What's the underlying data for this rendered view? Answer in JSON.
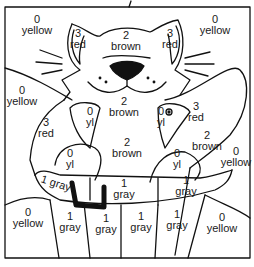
{
  "page": {
    "type": "color-by-number"
  },
  "legend_colors": {
    "0": {
      "name": "yellow",
      "hex": "#f5d90a"
    },
    "1": {
      "name": "gray",
      "hex": "#9a9a9a"
    },
    "2": {
      "name": "brown",
      "hex": "#8b5a2b"
    },
    "3": {
      "name": "red",
      "hex": "#d62a2a"
    }
  },
  "regions": [
    {
      "id": "bg-top-left",
      "num": "0",
      "color": "yellow"
    },
    {
      "id": "ear-left",
      "num": "3",
      "color": "red"
    },
    {
      "id": "head",
      "num": "2",
      "color": "brown"
    },
    {
      "id": "ear-right",
      "num": "3",
      "color": "red"
    },
    {
      "id": "bg-top-right",
      "num": "0",
      "color": "yellow"
    },
    {
      "id": "bg-left-mid",
      "num": "0",
      "color": "yellow"
    },
    {
      "id": "arm-left",
      "num": "3",
      "color": "red"
    },
    {
      "id": "fish-left",
      "num": "0",
      "color": "yl"
    },
    {
      "id": "chest",
      "num": "2",
      "color": "brown"
    },
    {
      "id": "fish-right",
      "num": "0",
      "color": "yl"
    },
    {
      "id": "arm-right",
      "num": "3",
      "color": "red"
    },
    {
      "id": "tail",
      "num": "2",
      "color": "brown"
    },
    {
      "id": "bg-right-mid",
      "num": "0",
      "color": "yellow"
    },
    {
      "id": "paw-left",
      "num": "0",
      "color": "yl"
    },
    {
      "id": "paw-right",
      "num": "0",
      "color": "yl"
    },
    {
      "id": "basket-rim-left",
      "num": "1",
      "color": "gray"
    },
    {
      "id": "basket-rim-center",
      "num": "1",
      "color": "gray"
    },
    {
      "id": "basket-rim-right",
      "num": "1",
      "color": "gray"
    },
    {
      "id": "bg-bottom-left",
      "num": "0",
      "color": "yellow"
    },
    {
      "id": "basket-slat-1",
      "num": "1",
      "color": "gray"
    },
    {
      "id": "basket-slat-2",
      "num": "1",
      "color": "gray"
    },
    {
      "id": "basket-slat-3",
      "num": "1",
      "color": "gray"
    },
    {
      "id": "basket-slat-4",
      "num": "1",
      "color": "gray"
    },
    {
      "id": "bg-bottom-right",
      "num": "0",
      "color": "yellow"
    }
  ]
}
